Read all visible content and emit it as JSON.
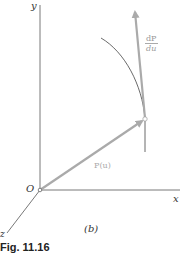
{
  "figure": {
    "caption": "Fig. 11.16",
    "panel_label": "(b)",
    "axes": {
      "x_label": "x",
      "y_label": "y",
      "z_label": "z",
      "origin_label": "O"
    },
    "vectors": {
      "position_label": "P(u)",
      "tangent_numerator": "dP",
      "tangent_denominator": "du"
    },
    "colors": {
      "axis": "#555555",
      "vector": "#aaaaaa",
      "curve": "#444444",
      "label_gray": "#999999"
    }
  }
}
